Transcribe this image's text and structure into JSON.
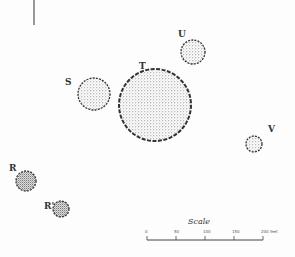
{
  "figure": {
    "type": "site plan of mounds",
    "north_line": {
      "x": 34,
      "y1": 0,
      "y2": 25
    }
  },
  "mounds": [
    {
      "id": "S",
      "label": "S",
      "cx": 94,
      "cy": 94,
      "r": 16,
      "label_x": 65,
      "label_y": 78
    },
    {
      "id": "T",
      "label": "T",
      "cx": 155,
      "cy": 105,
      "r": 36,
      "label_x": 139,
      "label_y": 62
    },
    {
      "id": "U",
      "label": "U",
      "cx": 193,
      "cy": 52,
      "r": 12,
      "label_x": 178,
      "label_y": 30
    },
    {
      "id": "V",
      "label": "V",
      "cx": 254,
      "cy": 144,
      "r": 8,
      "label_x": 268,
      "label_y": 125
    },
    {
      "id": "R",
      "label": "R",
      "cx": 26,
      "cy": 181,
      "r": 10,
      "label_x": 9,
      "label_y": 164
    },
    {
      "id": "R1",
      "label": "R'",
      "cx": 61,
      "cy": 209,
      "r": 8,
      "label_x": 44,
      "label_y": 202
    }
  ],
  "scale": {
    "title": "Scale",
    "ticks": [
      "0",
      "50",
      "100",
      "150",
      "200 feet"
    ],
    "x_start": 147,
    "x_end": 263,
    "y": 240
  },
  "colors": {
    "ink": "#333333",
    "stipple": "#7a7a7a",
    "paper": "#fdfdfd"
  }
}
